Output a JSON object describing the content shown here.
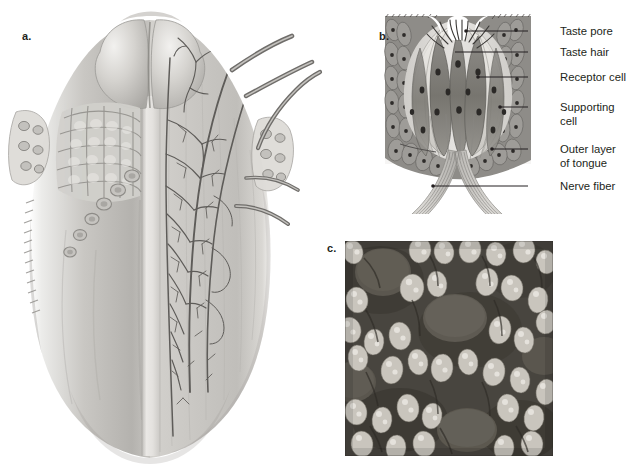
{
  "figure": {
    "background": "#ffffff",
    "ink": "#231f20"
  },
  "panels": [
    {
      "id": "a",
      "letter": "a.",
      "caption": "Dorsal view of tongue showing papillae, lingual tonsils and nerve supply",
      "letter_pos": {
        "x": 22,
        "y": 30
      },
      "content": "tongue-illustration"
    },
    {
      "id": "b",
      "letter": "b.",
      "caption": "Cross section of a taste bud",
      "letter_pos": {
        "x": 379,
        "y": 30
      },
      "content": "taste-bud-diagram"
    },
    {
      "id": "c",
      "letter": "c.",
      "caption": "Scanning electron micrograph of tongue surface papillae",
      "letter_pos": {
        "x": 327,
        "y": 242
      },
      "content": "electron-micrograph"
    }
  ],
  "taste_bud_labels": [
    {
      "key": "taste_pore",
      "text": "Taste pore",
      "x": 560,
      "y": 33,
      "leader": {
        "x1": 528,
        "y1": 31,
        "x2": 466,
        "y2": 31
      }
    },
    {
      "key": "taste_hair",
      "text": "Taste hair",
      "x": 560,
      "y": 54,
      "leader": {
        "x1": 528,
        "y1": 52,
        "x2": 455,
        "y2": 52
      }
    },
    {
      "key": "receptor_cell",
      "text": "Receptor cell",
      "x": 560,
      "y": 79,
      "leader": {
        "x1": 528,
        "y1": 77,
        "x2": 478,
        "y2": 77
      }
    },
    {
      "key": "supporting_cell_1",
      "text": "Supporting",
      "x": 560,
      "y": 109,
      "leader": {
        "x1": 528,
        "y1": 107,
        "x2": 500,
        "y2": 107
      }
    },
    {
      "key": "supporting_cell_2",
      "text": "cell",
      "x": 560,
      "y": 123,
      "leader": null
    },
    {
      "key": "outer_layer_1",
      "text": "Outer layer",
      "x": 560,
      "y": 151,
      "leader": {
        "x1": 528,
        "y1": 149,
        "x2": 492,
        "y2": 149
      }
    },
    {
      "key": "outer_layer_2",
      "text": "of tongue",
      "x": 560,
      "y": 165,
      "leader": null
    },
    {
      "key": "nerve_fiber",
      "text": "Nerve fiber",
      "x": 560,
      "y": 188,
      "leader": {
        "x1": 528,
        "y1": 186,
        "x2": 433,
        "y2": 186
      }
    }
  ],
  "tongue": {
    "left_half": "papillae and lingual tonsil surface detail",
    "right_half": "branching nerve supply, midline septum strip",
    "nerve_trunks": 3,
    "tonsil_lobes": 2,
    "circumvallate_papillae": 6,
    "foliate_clusters": 2
  },
  "micrograph": {
    "x": 345,
    "y": 241,
    "width": 208,
    "height": 215,
    "description": "fungiform papillae among filiform papillae",
    "tone_dark": "#3c3c3c",
    "tone_light": "#d8d6d2",
    "large_discs": 5
  },
  "colors": {
    "ink": "#231f20",
    "tissue_light": "#e3e1dd",
    "tissue_mid": "#b9b7b3",
    "tissue_dark": "#8e8c88",
    "epithelium": "#8a8a86",
    "nerve": "#6f6d6a"
  }
}
